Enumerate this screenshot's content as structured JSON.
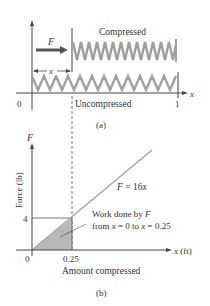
{
  "figure_a": {
    "label_compressed": "Compressed",
    "label_uncompressed": "Uncompressed",
    "force_label": "F",
    "x_label": "x",
    "axis_label": "x",
    "tick_0": "0",
    "tick_1": "1",
    "caption": "(a)"
  },
  "figure_b": {
    "y_axis_var": "F",
    "y_axis_title": "Force (lb)",
    "x_axis_title": "x (ft)",
    "x_axis_subtitle": "Amount compressed",
    "tick_0": "0",
    "tick_x": "0.25",
    "tick_y": "4",
    "equation": "F = 16x",
    "annotation_line1": "Work done by F",
    "annotation_line2": "from x = 0  to x = 0.25",
    "caption": "(b)"
  },
  "colors": {
    "spring": "#a0a0a0",
    "shaded": "#b8b8b8",
    "line": "#a8a8a8",
    "axis": "#444444",
    "arrow": "#555555"
  }
}
